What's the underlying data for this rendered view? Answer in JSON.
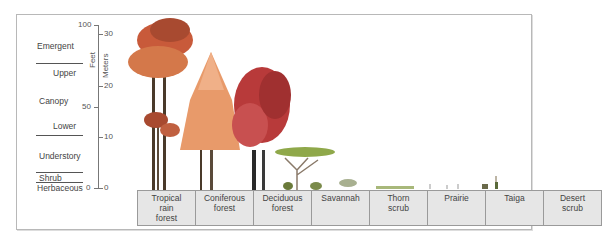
{
  "strata": [
    {
      "label": "Emergent",
      "x": 37,
      "y": 41
    },
    {
      "label": "Upper",
      "x": 53,
      "y": 68
    },
    {
      "label": "Canopy",
      "x": 39,
      "y": 96
    },
    {
      "label": "Lower",
      "x": 53,
      "y": 121
    },
    {
      "label": "Understory",
      "x": 39,
      "y": 151
    },
    {
      "label": "Shrub",
      "x": 39,
      "y": 173
    },
    {
      "label": "Herbaceous",
      "x": 37,
      "y": 183
    }
  ],
  "axis": {
    "feet_label": "Feet",
    "meters_label": "Meters",
    "feet_ticks": [
      {
        "label": "100",
        "y": 25
      },
      {
        "label": "50",
        "y": 107
      },
      {
        "label": "0",
        "y": 188
      }
    ],
    "meter_ticks": [
      {
        "label": "30",
        "y": 34
      },
      {
        "label": "20",
        "y": 86
      },
      {
        "label": "10",
        "y": 137
      },
      {
        "label": "0",
        "y": 188
      }
    ]
  },
  "biomes": [
    {
      "label": "Tropical\nrain\nforest"
    },
    {
      "label": "Coniferous\nforest"
    },
    {
      "label": "Deciduous\nforest"
    },
    {
      "label": "Savannah"
    },
    {
      "label": "Thorn\nscrub"
    },
    {
      "label": "Prairie"
    },
    {
      "label": "Taiga"
    },
    {
      "label": "Desert\nscrub"
    }
  ],
  "colors": {
    "rainforest": "#c85a3a",
    "conifer": "#e89a6a",
    "deciduous": "#b83a3a",
    "savanna": "#8fa84a",
    "grass": "#a8b87a",
    "box_fill": "#e6e6e6",
    "box_border": "#9a9a9a"
  }
}
